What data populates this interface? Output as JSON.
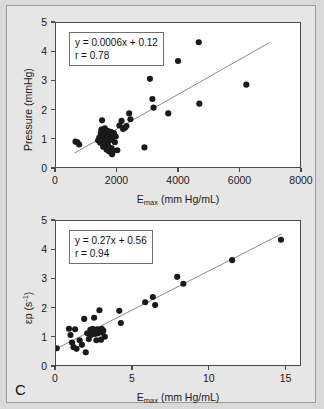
{
  "figure": {
    "panel_letter": "C",
    "background_color": "#e6e6e6",
    "plot_background_color": "#ffffff",
    "axis_color": "#4a4a4a",
    "marker_color": "#1a1a1a",
    "fit_line_color": "#8a8a8a"
  },
  "chart_data": [
    {
      "type": "scatter",
      "id": "pressure-vs-emax",
      "title": "",
      "xlabel": "Emax (mm Hg/mL)",
      "xlabel_base": "E",
      "xlabel_sub": "max",
      "xlabel_rest": " (mm Hg/mL)",
      "ylabel": "Pressure (mmHg)",
      "xlim": [
        0,
        8000
      ],
      "ylim": [
        0,
        5
      ],
      "xticks": [
        0,
        2000,
        4000,
        6000,
        8000
      ],
      "yticks": [
        0,
        1,
        2,
        3,
        4,
        5
      ],
      "grid": false,
      "legend": false,
      "annotation": {
        "equation": "y = 0.0006x + 0.12",
        "correlation": "r = 0.78"
      },
      "fit": {
        "slope": 0.0006,
        "intercept": 0.12,
        "r": 0.78,
        "x_start": 600,
        "x_end": 7000
      },
      "points": [
        [
          640,
          0.88
        ],
        [
          700,
          0.86
        ],
        [
          760,
          0.78
        ],
        [
          1380,
          0.92
        ],
        [
          1420,
          1.02
        ],
        [
          1450,
          0.84
        ],
        [
          1470,
          1.18
        ],
        [
          1490,
          1.3
        ],
        [
          1510,
          1.62
        ],
        [
          1530,
          1.12
        ],
        [
          1545,
          0.7
        ],
        [
          1560,
          1.24
        ],
        [
          1575,
          1.08
        ],
        [
          1590,
          0.96
        ],
        [
          1600,
          1.34
        ],
        [
          1615,
          1.2
        ],
        [
          1630,
          0.88
        ],
        [
          1645,
          1.14
        ],
        [
          1660,
          0.6
        ],
        [
          1675,
          1.06
        ],
        [
          1690,
          1.26
        ],
        [
          1700,
          0.78
        ],
        [
          1720,
          1.16
        ],
        [
          1740,
          0.54
        ],
        [
          1760,
          1.1
        ],
        [
          1780,
          0.94
        ],
        [
          1800,
          1.22
        ],
        [
          1820,
          0.66
        ],
        [
          1840,
          0.44
        ],
        [
          1860,
          1.02
        ],
        [
          1880,
          0.56
        ],
        [
          1900,
          1.18
        ],
        [
          1930,
          0.86
        ],
        [
          1960,
          1.06
        ],
        [
          2010,
          0.58
        ],
        [
          2080,
          1.44
        ],
        [
          2150,
          1.6
        ],
        [
          2200,
          1.32
        ],
        [
          2260,
          1.36
        ],
        [
          2310,
          1.42
        ],
        [
          2400,
          1.86
        ],
        [
          2440,
          1.66
        ],
        [
          2900,
          0.68
        ],
        [
          3080,
          3.06
        ],
        [
          3160,
          2.36
        ],
        [
          3200,
          2.06
        ],
        [
          3680,
          1.86
        ],
        [
          4000,
          3.68
        ],
        [
          4680,
          4.33
        ],
        [
          4700,
          2.2
        ],
        [
          6240,
          2.86
        ]
      ]
    },
    {
      "type": "scatter",
      "id": "epsilon-p-vs-emax",
      "title": "",
      "xlabel": "Emax (mm Hg/mL)",
      "xlabel_base": "E",
      "xlabel_sub": "max",
      "xlabel_rest": " (mm Hg/mL)",
      "ylabel": "εp (s-1)",
      "ylabel_base": "εp (s",
      "ylabel_sup": "-1",
      "ylabel_rest": ")",
      "xlim": [
        0,
        16
      ],
      "ylim": [
        0,
        5
      ],
      "xticks": [
        0,
        5,
        10,
        15
      ],
      "yticks": [
        0,
        1,
        2,
        3,
        4,
        5
      ],
      "grid": false,
      "legend": false,
      "annotation": {
        "equation": "y = 0.27x + 0.56",
        "correlation": "r = 0.94"
      },
      "fit": {
        "slope": 0.27,
        "intercept": 0.56,
        "r": 0.94,
        "x_start": 0.0,
        "x_end": 14.8
      },
      "points": [
        [
          0.05,
          0.58
        ],
        [
          0.85,
          1.26
        ],
        [
          0.95,
          1.04
        ],
        [
          1.05,
          0.78
        ],
        [
          1.15,
          0.62
        ],
        [
          1.25,
          1.24
        ],
        [
          1.35,
          0.56
        ],
        [
          1.55,
          0.86
        ],
        [
          1.7,
          0.7
        ],
        [
          1.85,
          1.6
        ],
        [
          1.95,
          0.44
        ],
        [
          2.05,
          1.1
        ],
        [
          2.15,
          0.9
        ],
        [
          2.25,
          1.22
        ],
        [
          2.3,
          1.04
        ],
        [
          2.4,
          1.26
        ],
        [
          2.45,
          1.12
        ],
        [
          2.5,
          1.64
        ],
        [
          2.55,
          1.08
        ],
        [
          2.6,
          1.18
        ],
        [
          2.65,
          0.86
        ],
        [
          2.7,
          1.24
        ],
        [
          2.75,
          1.1
        ],
        [
          2.8,
          1.22
        ],
        [
          2.85,
          1.9
        ],
        [
          2.9,
          1.16
        ],
        [
          2.95,
          0.88
        ],
        [
          3.0,
          1.26
        ],
        [
          3.05,
          1.12
        ],
        [
          3.1,
          1.2
        ],
        [
          3.2,
          0.98
        ],
        [
          4.15,
          1.88
        ],
        [
          4.25,
          1.46
        ],
        [
          5.85,
          2.18
        ],
        [
          6.35,
          2.36
        ],
        [
          6.5,
          2.08
        ],
        [
          7.95,
          3.06
        ],
        [
          8.35,
          2.82
        ],
        [
          11.55,
          3.64
        ],
        [
          14.75,
          4.35
        ]
      ]
    }
  ]
}
